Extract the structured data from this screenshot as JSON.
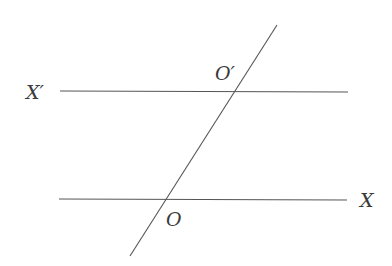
{
  "diagram": {
    "type": "parallel-lines-with-transversal",
    "colors": {
      "stroke": "#555555",
      "text": "#3a3a3a",
      "background": "#ffffff"
    },
    "lines": [
      {
        "id": "line-upper",
        "x1": 60,
        "y1": 91,
        "x2": 348,
        "y2": 92
      },
      {
        "id": "line-lower",
        "x1": 59,
        "y1": 199,
        "x2": 347,
        "y2": 200
      },
      {
        "id": "transversal",
        "x1": 277,
        "y1": 25,
        "x2": 130,
        "y2": 256
      }
    ],
    "labels": {
      "x_prime": {
        "text": "X′",
        "x": 26,
        "y": 99
      },
      "o_prime": {
        "text": "O′",
        "x": 215,
        "y": 80
      },
      "o": {
        "text": "O",
        "x": 166,
        "y": 226
      },
      "x": {
        "text": "X",
        "x": 360,
        "y": 207
      }
    }
  }
}
